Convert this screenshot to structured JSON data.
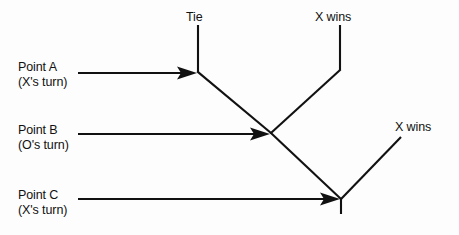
{
  "diagram": {
    "background_color": "#fdfdfd",
    "line_color": "#111111",
    "point_labels": [
      {
        "id": "point-a",
        "name": "Point A",
        "turn": "(X's turn)",
        "arrow": {
          "x1": 78,
          "y1": 73,
          "x2": 197,
          "y2": 73
        }
      },
      {
        "id": "point-b",
        "name": "Point B",
        "turn": "(O's turn)",
        "arrow": {
          "x1": 78,
          "y1": 134,
          "x2": 270,
          "y2": 134
        }
      },
      {
        "id": "point-c",
        "name": "Point C",
        "turn": "(X's turn)",
        "arrow": {
          "x1": 78,
          "y1": 199,
          "x2": 340,
          "y2": 199
        }
      }
    ],
    "outcome_labels": [
      {
        "id": "tie",
        "text": "Tie"
      },
      {
        "id": "x-wins-top",
        "text": "X wins"
      },
      {
        "id": "x-wins-right",
        "text": "X wins"
      }
    ],
    "nodes": {
      "point_a": {
        "x": 198,
        "y": 72
      },
      "point_b": {
        "x": 271,
        "y": 133
      },
      "point_c": {
        "x": 341,
        "y": 199
      }
    },
    "branches": [
      {
        "id": "tie-stem",
        "x1": 198,
        "y1": 25,
        "x2": 198,
        "y2": 72
      },
      {
        "id": "a-to-b",
        "x1": 198,
        "y1": 72,
        "x2": 271,
        "y2": 133
      },
      {
        "id": "xwins-top-stem",
        "x1": 340,
        "y1": 25,
        "x2": 340,
        "y2": 70
      },
      {
        "id": "b-to-xwins-top",
        "x1": 271,
        "y1": 133,
        "x2": 340,
        "y2": 70
      },
      {
        "id": "b-to-c",
        "x1": 271,
        "y1": 133,
        "x2": 341,
        "y2": 199
      },
      {
        "id": "c-to-xwins",
        "x1": 341,
        "y1": 199,
        "x2": 401,
        "y2": 137
      },
      {
        "id": "c-stub",
        "x1": 341,
        "y1": 199,
        "x2": 341,
        "y2": 214
      }
    ]
  }
}
